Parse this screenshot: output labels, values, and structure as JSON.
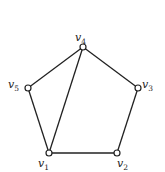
{
  "graph": {
    "vertices": [
      {
        "id": "v1",
        "name": "v",
        "sub": "1",
        "x": 49,
        "y": 153,
        "lx": 38,
        "ly": 167
      },
      {
        "id": "v2",
        "name": "v",
        "sub": "2",
        "x": 117,
        "y": 153,
        "lx": 117,
        "ly": 167
      },
      {
        "id": "v3",
        "name": "v",
        "sub": "3",
        "x": 138,
        "y": 88,
        "lx": 142,
        "ly": 88
      },
      {
        "id": "v4",
        "name": "v",
        "sub": "4",
        "x": 83,
        "y": 47,
        "lx": 75,
        "ly": 41
      },
      {
        "id": "v5",
        "name": "v",
        "sub": "5",
        "x": 28,
        "y": 88,
        "lx": 8,
        "ly": 88
      }
    ],
    "edges": [
      [
        "v1",
        "v2"
      ],
      [
        "v2",
        "v3"
      ],
      [
        "v3",
        "v4"
      ],
      [
        "v4",
        "v5"
      ],
      [
        "v5",
        "v1"
      ],
      [
        "v1",
        "v4"
      ]
    ],
    "colors": {
      "stroke": "#222222",
      "fill": "#ffffff"
    }
  }
}
